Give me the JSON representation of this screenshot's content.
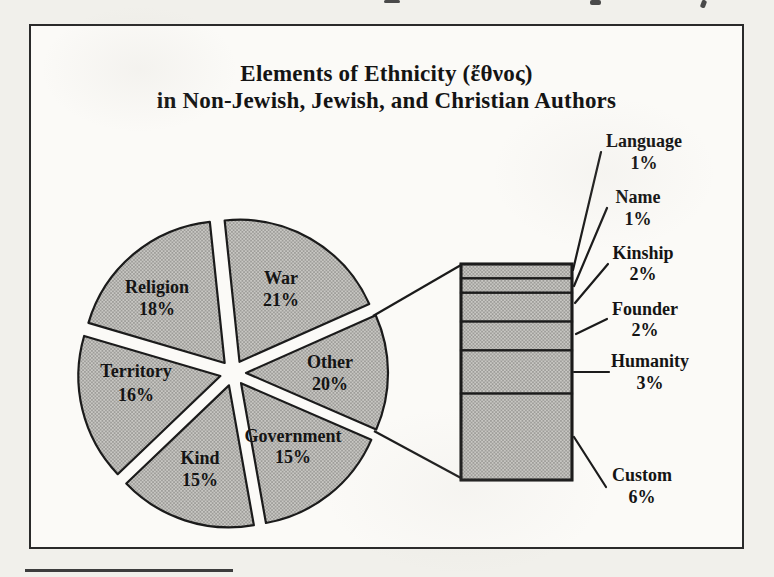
{
  "chart_data": {
    "type": "bar-of-pie",
    "title": "Elements of Ethnicity (ἔθνος) in Non-Jewish, Jewish, and Christian Authors",
    "title_lines": [
      "Elements of Ethnicity (ἔθνος)",
      "in Non-Jewish, Jewish, and Christian Authors"
    ],
    "pie": {
      "slices": [
        {
          "label": "War",
          "value_pct": 21,
          "pct_label": "21%"
        },
        {
          "label": "Other",
          "value_pct": 20,
          "pct_label": "20%"
        },
        {
          "label": "Government",
          "value_pct": 15,
          "pct_label": "15%"
        },
        {
          "label": "Kind",
          "value_pct": 15,
          "pct_label": "15%"
        },
        {
          "label": "Territory",
          "value_pct": 16,
          "pct_label": "16%"
        },
        {
          "label": "Religion",
          "value_pct": 18,
          "pct_label": "18%"
        }
      ],
      "style": "exploded, gray halftone fill, black outlines"
    },
    "bar": {
      "detail_of_slice": "Other",
      "segments": [
        {
          "label": "Language",
          "value_pct": 1,
          "pct_label": "1%"
        },
        {
          "label": "Name",
          "value_pct": 1,
          "pct_label": "1%"
        },
        {
          "label": "Kinship",
          "value_pct": 2,
          "pct_label": "2%"
        },
        {
          "label": "Founder",
          "value_pct": 2,
          "pct_label": "2%"
        },
        {
          "label": "Humanity",
          "value_pct": 3,
          "pct_label": "3%"
        },
        {
          "label": "Custom",
          "value_pct": 6,
          "pct_label": "6%"
        }
      ]
    },
    "legend": "none (labels placed on/beside shapes with leader lines)",
    "colors": {
      "slice_fill": "#b2b1ae",
      "outline": "#1b1b1b",
      "paper": "#fbfaf7"
    }
  }
}
